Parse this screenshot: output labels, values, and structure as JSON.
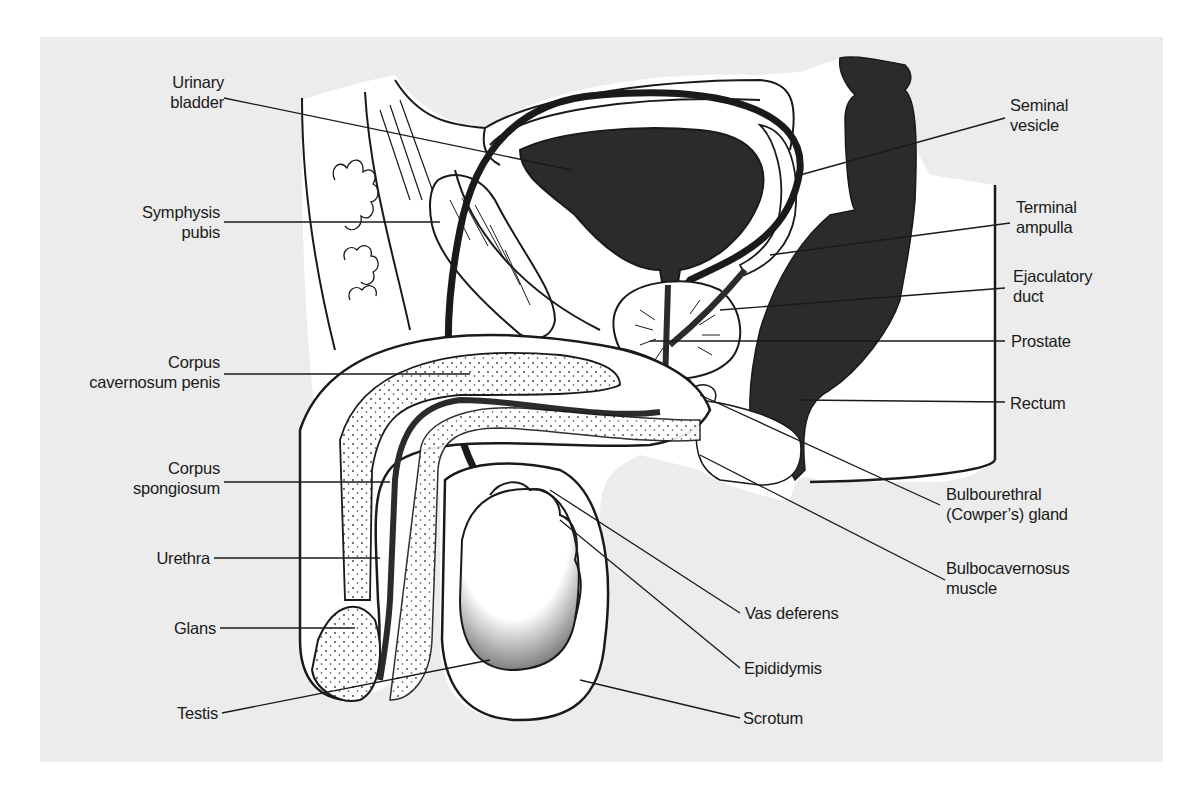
{
  "figure": {
    "type": "anatomical-diagram",
    "colors": {
      "background_panel": "#ececec",
      "page": "#ffffff",
      "ink": "#1a1a1a",
      "dark_fill": "#2b2b2b",
      "tissue": "#ffffff"
    }
  },
  "labels_left": [
    {
      "id": "urinary-bladder",
      "lines": [
        "Urinary",
        "bladder"
      ]
    },
    {
      "id": "symphysis-pubis",
      "lines": [
        "Symphysis",
        "pubis"
      ]
    },
    {
      "id": "corpus-cavernosum-penis",
      "lines": [
        "Corpus",
        "cavernosum penis"
      ]
    },
    {
      "id": "corpus-spongiosum",
      "lines": [
        "Corpus",
        "spongiosum"
      ]
    },
    {
      "id": "urethra",
      "lines": [
        "Urethra"
      ]
    },
    {
      "id": "glans",
      "lines": [
        "Glans"
      ]
    },
    {
      "id": "testis",
      "lines": [
        "Testis"
      ]
    }
  ],
  "labels_right": [
    {
      "id": "seminal-vesicle",
      "lines": [
        "Seminal",
        "vesicle"
      ]
    },
    {
      "id": "terminal-ampulla",
      "lines": [
        "Terminal",
        "ampulla"
      ]
    },
    {
      "id": "ejaculatory-duct",
      "lines": [
        "Ejaculatory",
        "duct"
      ]
    },
    {
      "id": "prostate",
      "lines": [
        "Prostate"
      ]
    },
    {
      "id": "rectum",
      "lines": [
        "Rectum"
      ]
    },
    {
      "id": "bulbourethral-gland",
      "lines": [
        "Bulbourethral",
        "(Cowper’s) gland"
      ]
    },
    {
      "id": "bulbocavernosus-muscle",
      "lines": [
        "Bulbocavernosus",
        "muscle"
      ]
    }
  ],
  "labels_bottom": [
    {
      "id": "vas-deferens",
      "lines": [
        "Vas deferens"
      ]
    },
    {
      "id": "epididymis",
      "lines": [
        "Epididymis"
      ]
    },
    {
      "id": "scrotum",
      "lines": [
        "Scrotum"
      ]
    }
  ]
}
